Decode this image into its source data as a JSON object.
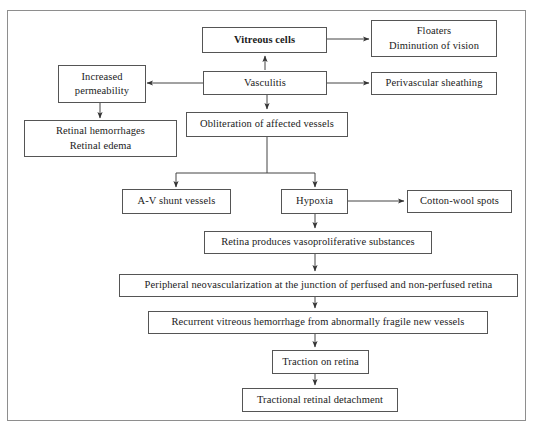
{
  "diagram": {
    "border_color": "#8e8e8e",
    "box_border_color": "#555555",
    "text_color": "#1b1b1b",
    "background": "#ffffff"
  },
  "nodes": {
    "vitreous_cells": {
      "label": "Vitreous cells"
    },
    "floaters": {
      "line1": "Floaters",
      "line2": "Diminution of vision"
    },
    "vasculitis": {
      "label": "Vasculitis"
    },
    "perivascular_sheathing": {
      "label": "Perivascular sheathing"
    },
    "increased_permeability": {
      "line1": "Increased",
      "line2": "permeability"
    },
    "retinal_hemorrhages": {
      "line1": "Retinal hemorrhages",
      "line2": "Retinal edema"
    },
    "obliteration": {
      "label": "Obliteration of affected vessels"
    },
    "av_shunt": {
      "label": "A-V shunt vessels"
    },
    "hypoxia": {
      "label": "Hypoxia"
    },
    "cotton_wool": {
      "label": "Cotton-wool spots"
    },
    "retina_produces": {
      "label": "Retina produces vasoproliferative substances"
    },
    "peripheral_neo": {
      "label": "Peripheral neovascularization at the junction of perfused and non-perfused retina"
    },
    "recurrent_hemorrhage": {
      "label": "Recurrent vitreous hemorrhage from abnormally fragile new vessels"
    },
    "traction": {
      "label": "Traction on retina"
    },
    "detachment": {
      "label": "Tractional retinal detachment"
    }
  },
  "edges": [
    {
      "from": "vasculitis",
      "to": "vitreous_cells",
      "direction": "up"
    },
    {
      "from": "vitreous_cells",
      "to": "floaters",
      "direction": "right"
    },
    {
      "from": "vasculitis",
      "to": "perivascular_sheathing",
      "direction": "right"
    },
    {
      "from": "vasculitis",
      "to": "increased_permeability",
      "direction": "left"
    },
    {
      "from": "vasculitis",
      "to": "obliteration",
      "direction": "down"
    },
    {
      "from": "increased_permeability",
      "to": "retinal_hemorrhages",
      "direction": "down"
    },
    {
      "from": "obliteration",
      "to": "av_shunt",
      "direction": "down-split-left"
    },
    {
      "from": "obliteration",
      "to": "hypoxia",
      "direction": "down-split-right"
    },
    {
      "from": "hypoxia",
      "to": "cotton_wool",
      "direction": "right"
    },
    {
      "from": "hypoxia",
      "to": "retina_produces",
      "direction": "down"
    },
    {
      "from": "retina_produces",
      "to": "peripheral_neo",
      "direction": "down"
    },
    {
      "from": "peripheral_neo",
      "to": "recurrent_hemorrhage",
      "direction": "down"
    },
    {
      "from": "recurrent_hemorrhage",
      "to": "traction",
      "direction": "down"
    },
    {
      "from": "traction",
      "to": "detachment",
      "direction": "down"
    }
  ]
}
